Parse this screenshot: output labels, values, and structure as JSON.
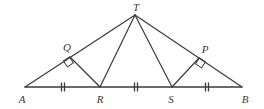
{
  "figure": {
    "kind": "geometry-diagram",
    "background_color": "#ffffff",
    "stroke_color": "#3b3b3b",
    "label_color": "#3b3b3b",
    "stroke_width": 1.2,
    "width": 264,
    "height": 109
  },
  "points": {
    "A": {
      "label": "A",
      "x": 25,
      "y": 87,
      "label_x": 22,
      "label_y": 99
    },
    "B": {
      "label": "B",
      "x": 242,
      "y": 87,
      "label_x": 245,
      "label_y": 99
    },
    "T": {
      "label": "T",
      "x": 135,
      "y": 15,
      "label_x": 136,
      "label_y": 7
    },
    "R": {
      "label": "R",
      "x": 100,
      "y": 87,
      "label_x": 100,
      "label_y": 99
    },
    "S": {
      "label": "S",
      "x": 172,
      "y": 87,
      "label_x": 171,
      "label_y": 99
    },
    "Q": {
      "label": "Q",
      "x": 70,
      "y": 57,
      "label_x": 67,
      "label_y": 47
    },
    "P": {
      "label": "P",
      "x": 199,
      "y": 58,
      "label_x": 205,
      "label_y": 49
    }
  },
  "segments": [
    {
      "name": "side-AT",
      "from": "A",
      "to": "T"
    },
    {
      "name": "side-TB",
      "from": "T",
      "to": "B"
    },
    {
      "name": "base-AB",
      "from": "A",
      "to": "B"
    },
    {
      "name": "cevian-TR",
      "from": "T",
      "to": "R"
    },
    {
      "name": "cevian-TS",
      "from": "T",
      "to": "S"
    },
    {
      "name": "perpendicular-RQ",
      "from": "R",
      "to": "Q"
    },
    {
      "name": "perpendicular-SP",
      "from": "S",
      "to": "P"
    }
  ],
  "right_angles": [
    {
      "name": "right-angle-at-Q",
      "vertex": "Q",
      "size": 7,
      "rotation": -33
    },
    {
      "name": "right-angle-at-P",
      "vertex": "P",
      "size": 7,
      "rotation": 33
    }
  ],
  "tick_marks": [
    {
      "name": "tick-AR",
      "segment": "A-R",
      "x": 63,
      "y": 87,
      "count": 2,
      "length": 9,
      "spacing": 3
    },
    {
      "name": "tick-RS",
      "segment": "R-S",
      "x": 136,
      "y": 87,
      "count": 2,
      "length": 9,
      "spacing": 3
    },
    {
      "name": "tick-SB",
      "segment": "S-B",
      "x": 207,
      "y": 87,
      "count": 2,
      "length": 9,
      "spacing": 3
    }
  ],
  "congruence_note": "Segments AR, RS and SB are marked congruent with double tick marks."
}
